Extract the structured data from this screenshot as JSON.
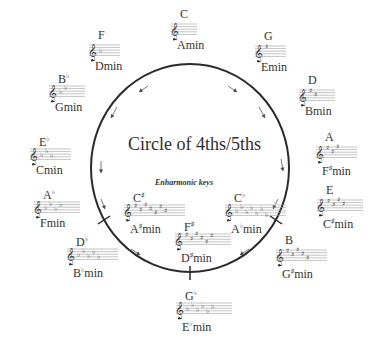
{
  "title": "Circle of 4ths/5ths",
  "enharmonic_label": "Enharmonic keys",
  "circle": {
    "cx": 190,
    "cy": 168,
    "rx": 99,
    "ry": 104,
    "stroke": "#2a2a2a"
  },
  "keys": [
    {
      "id": "c",
      "major": "C",
      "major_acc": "",
      "minor": "A",
      "minor_acc": "",
      "minor_suffix": "min",
      "accidental_type": "none",
      "count": 0,
      "x": 168,
      "y": 8
    },
    {
      "id": "g",
      "major": "G",
      "major_acc": "",
      "minor": "E",
      "minor_acc": "",
      "minor_suffix": "min",
      "accidental_type": "sharp",
      "count": 1,
      "x": 252,
      "y": 30
    },
    {
      "id": "d",
      "major": "D",
      "major_acc": "",
      "minor": "B",
      "minor_acc": "",
      "minor_suffix": "min",
      "accidental_type": "sharp",
      "count": 2,
      "x": 296,
      "y": 74
    },
    {
      "id": "a",
      "major": "A",
      "major_acc": "",
      "minor": "F",
      "minor_acc": "♯",
      "minor_suffix": "min",
      "accidental_type": "sharp",
      "count": 3,
      "x": 313,
      "y": 131
    },
    {
      "id": "e",
      "major": "E",
      "major_acc": "",
      "minor": "C",
      "minor_acc": "♯",
      "minor_suffix": "min",
      "accidental_type": "sharp",
      "count": 4,
      "x": 314,
      "y": 184
    },
    {
      "id": "b",
      "major": "B",
      "major_acc": "",
      "minor": "G",
      "minor_acc": "♯",
      "minor_suffix": "min",
      "accidental_type": "sharp",
      "count": 5,
      "x": 273,
      "y": 234
    },
    {
      "id": "gb",
      "major": "G",
      "major_acc": "♭",
      "minor": "E",
      "minor_acc": "♭",
      "minor_suffix": "min",
      "accidental_type": "flat",
      "count": 6,
      "x": 173,
      "y": 287
    },
    {
      "id": "db",
      "major": "D",
      "major_acc": "♭",
      "minor": "B",
      "minor_acc": "♭",
      "minor_suffix": "min",
      "accidental_type": "flat",
      "count": 5,
      "x": 64,
      "y": 233
    },
    {
      "id": "ab",
      "major": "A",
      "major_acc": "♭",
      "minor": "F",
      "minor_acc": "",
      "minor_suffix": "min",
      "accidental_type": "flat",
      "count": 4,
      "x": 31,
      "y": 186
    },
    {
      "id": "eb",
      "major": "E",
      "major_acc": "♭",
      "minor": "C",
      "minor_acc": "",
      "minor_suffix": "min",
      "accidental_type": "flat",
      "count": 3,
      "x": 27,
      "y": 133
    },
    {
      "id": "bb",
      "major": "B",
      "major_acc": "♭",
      "minor": "G",
      "minor_acc": "",
      "minor_suffix": "min",
      "accidental_type": "flat",
      "count": 2,
      "x": 46,
      "y": 70
    },
    {
      "id": "f",
      "major": "F",
      "major_acc": "",
      "minor": "D",
      "minor_acc": "",
      "minor_suffix": "min",
      "accidental_type": "flat",
      "count": 1,
      "x": 86,
      "y": 29
    }
  ],
  "enharmonic_keys": [
    {
      "id": "cs",
      "major": "C",
      "major_acc": "♯",
      "minor": "A",
      "minor_acc": "♯",
      "minor_suffix": "min",
      "accidental_type": "sharp",
      "count": 7,
      "x": 121,
      "y": 189
    },
    {
      "id": "cb",
      "major": "C",
      "major_acc": "♭",
      "minor": "A",
      "minor_acc": "♭",
      "minor_suffix": "min",
      "accidental_type": "flat",
      "count": 7,
      "x": 222,
      "y": 189
    },
    {
      "id": "fs",
      "major": "F",
      "major_acc": "♯",
      "minor": "D",
      "minor_acc": "♯",
      "minor_suffix": "min",
      "accidental_type": "sharp",
      "count": 6,
      "x": 172,
      "y": 218
    }
  ],
  "arrows": [
    {
      "x1": 148,
      "y1": 86,
      "x2": 139,
      "y2": 92
    },
    {
      "x1": 117,
      "y1": 107,
      "x2": 111,
      "y2": 118
    },
    {
      "x1": 101,
      "y1": 161,
      "x2": 101,
      "y2": 173
    },
    {
      "x1": 101,
      "y1": 199,
      "x2": 105,
      "y2": 209
    },
    {
      "x1": 131,
      "y1": 249,
      "x2": 140,
      "y2": 255
    },
    {
      "x1": 228,
      "y1": 86,
      "x2": 237,
      "y2": 92
    },
    {
      "x1": 259,
      "y1": 107,
      "x2": 265,
      "y2": 118
    },
    {
      "x1": 281,
      "y1": 159,
      "x2": 283,
      "y2": 171
    },
    {
      "x1": 278,
      "y1": 199,
      "x2": 273,
      "y2": 209
    },
    {
      "x1": 249,
      "y1": 249,
      "x2": 240,
      "y2": 255
    }
  ],
  "ticks": [
    {
      "x1": 98,
      "y1": 224,
      "x2": 110,
      "y2": 216
    },
    {
      "x1": 270,
      "y1": 216,
      "x2": 282,
      "y2": 224
    },
    {
      "x1": 190,
      "y1": 266,
      "x2": 190,
      "y2": 280
    }
  ]
}
